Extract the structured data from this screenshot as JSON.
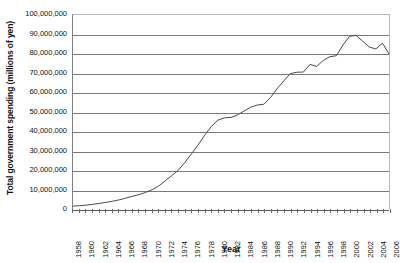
{
  "chart_data": {
    "type": "line",
    "title": "",
    "xlabel": "Year",
    "ylabel": "Total government spending (millions of yen)",
    "xlim": [
      1958,
      2006
    ],
    "ylim": [
      0,
      100000000
    ],
    "grid": true,
    "legend": false,
    "legend_position": "none",
    "line_color": "#4a4a4a",
    "y_tick_labels": [
      "100,000,000",
      "90,000,000",
      "80,000,000",
      "70,000,000",
      "60,000,000",
      "50,000,000",
      "40,000,000",
      "30,000,000",
      "20,000,000",
      "10,000,000",
      "0"
    ],
    "y_tick_values": [
      100000000,
      90000000,
      80000000,
      70000000,
      60000000,
      50000000,
      40000000,
      30000000,
      20000000,
      10000000,
      0
    ],
    "x_tick_labels": [
      "1958",
      "1960",
      "1962",
      "1964",
      "1966",
      "1968",
      "1970",
      "1972",
      "1974",
      "1976",
      "1978",
      "1980",
      "1982",
      "1984",
      "1986",
      "1988",
      "1990",
      "1992",
      "1994",
      "1996",
      "1998",
      "2000",
      "2002",
      "2004",
      "2006"
    ],
    "x_tick_values": [
      1958,
      1960,
      1962,
      1964,
      1966,
      1968,
      1970,
      1972,
      1974,
      1976,
      1978,
      1980,
      1982,
      1984,
      1986,
      1988,
      1990,
      1992,
      1994,
      1996,
      1998,
      2000,
      2002,
      2004,
      2006
    ],
    "x": [
      1958,
      1959,
      1960,
      1961,
      1962,
      1963,
      1964,
      1965,
      1966,
      1967,
      1968,
      1969,
      1970,
      1971,
      1972,
      1973,
      1974,
      1975,
      1976,
      1977,
      1978,
      1979,
      1980,
      1981,
      1982,
      1983,
      1984,
      1985,
      1986,
      1987,
      1988,
      1989,
      1990,
      1991,
      1992,
      1993,
      1994,
      1995,
      1996,
      1997,
      1998,
      1999,
      2000,
      2001,
      2002,
      2003,
      2004,
      2005,
      2006
    ],
    "series": [
      {
        "name": "Total government spending",
        "values": [
          1500000,
          1700000,
          2000000,
          2400000,
          2900000,
          3400000,
          4000000,
          4700000,
          5600000,
          6500000,
          7400000,
          8500000,
          9900000,
          11800000,
          14500000,
          17200000,
          20000000,
          24000000,
          28500000,
          33000000,
          38000000,
          42500000,
          45800000,
          47000000,
          47200000,
          48500000,
          50500000,
          52500000,
          53600000,
          54000000,
          57500000,
          62000000,
          66000000,
          69800000,
          70500000,
          70600000,
          74500000,
          73500000,
          76500000,
          78500000,
          79000000,
          84500000,
          89000000,
          89500000,
          86500000,
          83500000,
          82500000,
          85500000,
          80000000
        ]
      }
    ]
  },
  "axes": {
    "y_title": "Total government spending (millions of yen)",
    "x_title": "Year"
  }
}
